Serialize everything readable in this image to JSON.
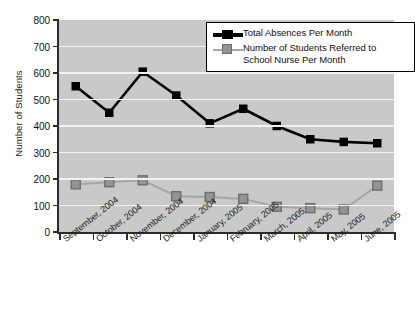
{
  "chart_data": {
    "type": "line",
    "title": "",
    "xlabel": "",
    "ylabel": "Number of Students",
    "ylim": [
      0,
      800
    ],
    "ytick_step": 100,
    "yticks": [
      0,
      100,
      200,
      300,
      400,
      500,
      600,
      700,
      800
    ],
    "grid": true,
    "legend_position": "top-right",
    "plot_background": "#c9c9c9",
    "categories": [
      "September, 2004",
      "October, 2004",
      "November, 2004",
      "December, 2004",
      "January, 2005",
      "February, 2005",
      "March, 2005",
      "April, 2005",
      "May, 2005",
      "June, 2005"
    ],
    "series": [
      {
        "name": "Total Absences Per Month",
        "color": "#000000",
        "marker": "square",
        "values": [
          550,
          450,
          605,
          515,
          410,
          465,
          400,
          350,
          340,
          335
        ]
      },
      {
        "name": "Number of Students Referred to School Nurse Per Month",
        "color": "#949494",
        "marker": "square",
        "values": [
          180,
          188,
          195,
          135,
          132,
          125,
          95,
          90,
          85,
          175
        ]
      }
    ]
  },
  "legend": {
    "entries": [
      {
        "label": "Total Absences Per Month"
      },
      {
        "label": "Number of Students Referred to School Nurse Per Month"
      }
    ]
  }
}
